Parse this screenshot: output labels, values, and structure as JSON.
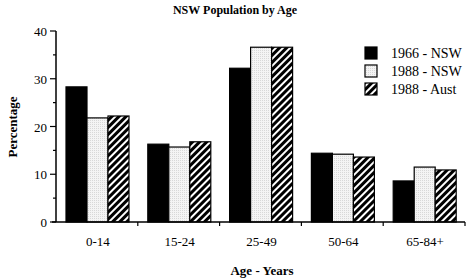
{
  "chart_data": {
    "type": "bar",
    "title": "NSW Population by Age",
    "xlabel": "Age - Years",
    "ylabel": "Percentage",
    "ylim": [
      0,
      40
    ],
    "yticks": [
      0,
      10,
      20,
      30,
      40
    ],
    "grid": false,
    "legend_position": "top-right",
    "categories": [
      "0-14",
      "15-24",
      "25-49",
      "50-64",
      "65-84+"
    ],
    "series": [
      {
        "name": "1966 - NSW",
        "fill": "solid-black",
        "values": [
          28.3,
          16.3,
          32.2,
          14.4,
          8.6
        ]
      },
      {
        "name": "1988 - NSW",
        "fill": "light-stipple",
        "values": [
          21.8,
          15.7,
          36.6,
          14.2,
          11.5
        ]
      },
      {
        "name": "1988 - Aust",
        "fill": "diagonal-hatch",
        "values": [
          22.2,
          16.8,
          36.6,
          13.6,
          10.9
        ]
      }
    ]
  },
  "colors": {
    "solid": "#000000",
    "stipple": "#efefef",
    "axis": "#000000"
  }
}
